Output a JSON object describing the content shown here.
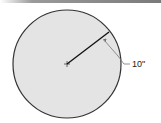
{
  "figure": {
    "shape": "circle",
    "radius_label": "10\"",
    "colors": {
      "fill": "#e4e4e4",
      "stroke": "#333333",
      "top_bar": "#8a8a8a"
    },
    "geometry": {
      "center": [
        67,
        64
      ],
      "radius": 54,
      "radius_end": [
        109,
        32
      ],
      "label_pos": [
        119,
        67
      ]
    }
  }
}
